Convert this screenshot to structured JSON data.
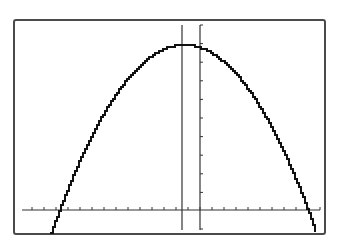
{
  "chart_data": {
    "type": "line",
    "title": "",
    "xlabel": "",
    "ylabel": "",
    "grid": false,
    "legend": null,
    "x_axis": {
      "tick_count": 25,
      "tick_spacing_px": 12
    },
    "y_axis": {
      "tick_count": 10,
      "tick_spacing_px": 18.6
    },
    "series": [
      {
        "name": "parabola",
        "shape": "downward parabola",
        "vertex_px": [
          182,
          44
        ],
        "roots_px": [
          [
            58,
            210
          ],
          [
            307,
            210
          ]
        ],
        "endpoints_px": [
          [
            50,
            229
          ],
          [
            314,
            229
          ]
        ]
      }
    ],
    "vertical_line": {
      "x_px": 182,
      "note": "vertical line through the vertex"
    }
  },
  "colors": {
    "background": "#ffffff",
    "frame": "#4a4a4a",
    "curve": "#111111",
    "axes": "#333333"
  }
}
